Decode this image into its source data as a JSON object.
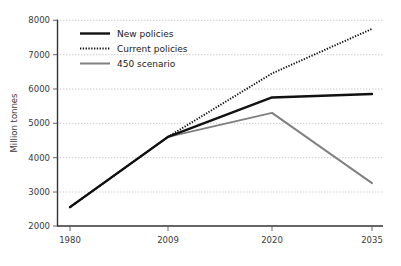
{
  "chart_data": {
    "type": "line",
    "title": "",
    "xlabel": "",
    "ylabel": "Million tonnes",
    "x": [
      "1980",
      "2009",
      "2020",
      "2035"
    ],
    "xticklabels": [
      "1980",
      "2009",
      "2020",
      "2035"
    ],
    "yticklabels": [
      "2000",
      "3000",
      "4000",
      "5000",
      "6000",
      "7000",
      "8000"
    ],
    "yticks": [
      2000,
      3000,
      4000,
      5000,
      6000,
      7000,
      8000
    ],
    "ylim": [
      2000,
      8000
    ],
    "grid": "horizontal-dotted",
    "legend_position": "upper-left-inside",
    "series": [
      {
        "name": "New policies",
        "values": [
          2550,
          4600,
          5750,
          5850
        ],
        "color": "#111111",
        "style": "solid",
        "width": 2.4
      },
      {
        "name": "Current policies",
        "values": [
          2550,
          4600,
          6450,
          7750
        ],
        "color": "#111111",
        "style": "dotted",
        "width": 1.9
      },
      {
        "name": "450 scenario",
        "values": [
          2550,
          4600,
          5300,
          3250
        ],
        "color": "#808080",
        "style": "solid",
        "width": 1.9
      }
    ]
  },
  "legend": {
    "items": [
      {
        "label": "New policies"
      },
      {
        "label": "Current policies"
      },
      {
        "label": "450 scenario"
      }
    ]
  },
  "axes": {
    "y_title": "Million tonnes",
    "y_labels": [
      "8000",
      "7000",
      "6000",
      "5000",
      "4000",
      "3000",
      "2000"
    ],
    "x_labels": [
      "1980",
      "2009",
      "2020",
      "2035"
    ]
  },
  "colors": {
    "series_dark": "#111111",
    "series_gray": "#808080",
    "grid": "#b4b4b4",
    "axis": "#333333",
    "background": "#ffffff"
  }
}
